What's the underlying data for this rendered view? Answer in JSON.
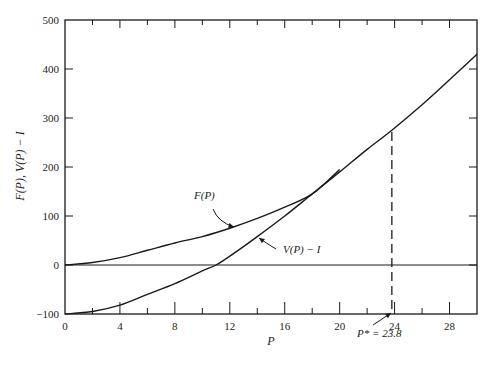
{
  "chart_data": {
    "type": "line",
    "title": "",
    "xlabel": "P",
    "ylabel": "F(P), V(P) − I",
    "xlim": [
      0,
      30
    ],
    "ylim": [
      -100,
      500
    ],
    "grid": false,
    "legend": "none (inline curve labels with arrows)",
    "x_ticks": [
      0,
      4,
      8,
      12,
      16,
      20,
      24,
      28
    ],
    "x_minor_ticks": [
      2,
      6,
      10,
      14,
      18,
      22,
      26
    ],
    "y_ticks": [
      -100,
      0,
      100,
      200,
      300,
      400,
      500
    ],
    "series": [
      {
        "name": "F(P)",
        "label": "F(P)",
        "x": [
          0,
          2,
          4,
          6,
          8,
          10,
          12,
          14,
          16,
          18,
          20
        ],
        "y": [
          0,
          5,
          15,
          30,
          45,
          58,
          75,
          95,
          118,
          145,
          195
        ]
      },
      {
        "name": "V(P) − I",
        "label": "V(P) − I",
        "x": [
          0,
          2,
          4,
          6,
          8,
          10,
          11,
          12,
          14,
          16,
          18,
          20,
          22,
          23.8,
          26,
          28,
          30
        ],
        "y": [
          -100,
          -95,
          -82,
          -60,
          -38,
          -12,
          0,
          18,
          58,
          100,
          145,
          190,
          236,
          275,
          327,
          378,
          430
        ]
      }
    ],
    "annotations": [
      {
        "type": "horizontal-line",
        "y": 0,
        "label": ""
      },
      {
        "type": "vertical-dashed-line",
        "x": 23.8,
        "y_from": 0,
        "y_to": 275
      },
      {
        "type": "arrow-label",
        "text": "P* = 23.8",
        "points_to_x": 23.8
      }
    ],
    "optimal_point": {
      "label": "P*",
      "value": 23.8
    }
  },
  "labels": {
    "x_axis_title": "P",
    "y_axis_title": "F(P), V(P) − I",
    "f_curve": "F(P)",
    "v_curve": "V(P) − I",
    "p_star": "P* = 23.8"
  }
}
